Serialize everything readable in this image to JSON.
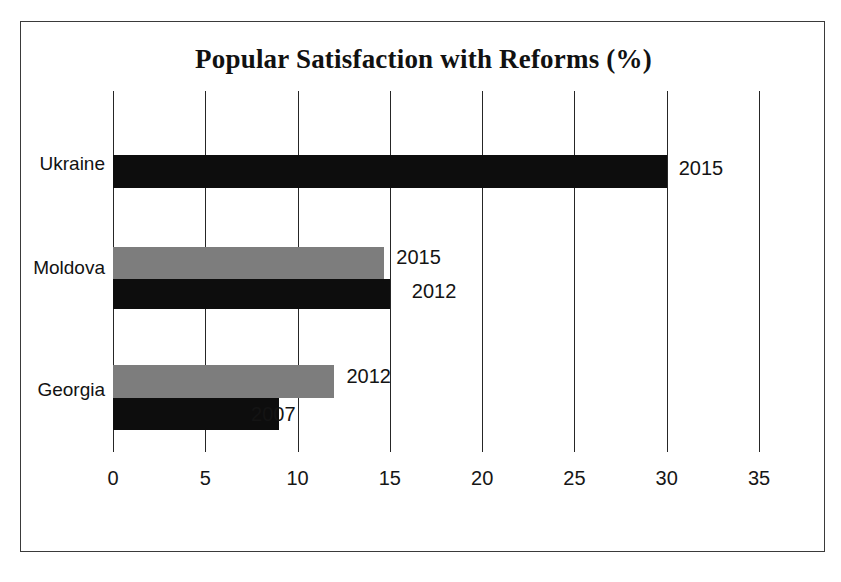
{
  "chart_data": {
    "type": "bar",
    "orientation": "horizontal",
    "title": "Popular Satisfaction with Reforms (%)",
    "xlabel": "",
    "ylabel": "",
    "xlim": [
      0,
      35
    ],
    "xticks": [
      0,
      5,
      10,
      15,
      20,
      25,
      30,
      35
    ],
    "xtick_labels": [
      "0",
      "5",
      "10",
      "15",
      "20",
      "25",
      "30",
      "35"
    ],
    "grid": true,
    "legend": "none",
    "categories": [
      "Ukraine",
      "Moldova",
      "Georgia"
    ],
    "colors": {
      "dark_series": "#0d0d0d",
      "gray_series": "#7d7d7d",
      "axis": "#262626",
      "frame": "#3a3a3a",
      "background": "#ffffff"
    },
    "bars": [
      {
        "category": "Ukraine",
        "year": "2015",
        "value": 30.0,
        "color": "#0d0d0d"
      },
      {
        "category": "Moldova",
        "year": "2015",
        "value": 14.7,
        "color": "#7d7d7d"
      },
      {
        "category": "Moldova",
        "year": "2012",
        "value": 15.0,
        "color": "#0d0d0d"
      },
      {
        "category": "Georgia",
        "year": "2012",
        "value": 12.0,
        "color": "#7d7d7d"
      },
      {
        "category": "Georgia",
        "year": "2007",
        "value": 9.0,
        "color": "#0d0d0d"
      }
    ],
    "annotations": [
      "2015",
      "2015",
      "2012",
      "2012",
      "2007"
    ]
  }
}
